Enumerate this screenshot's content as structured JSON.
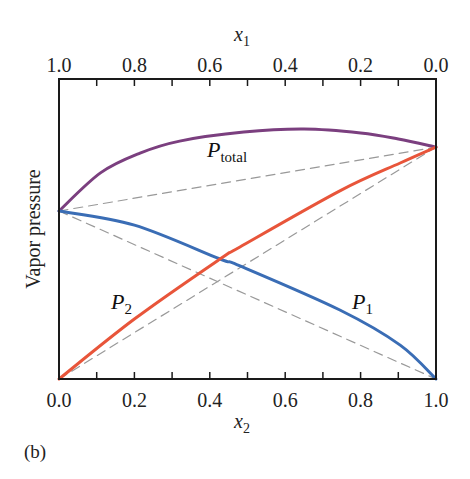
{
  "chart_data": {
    "type": "line",
    "title": "",
    "panel_label": "(b)",
    "xlabel": "x2",
    "xlabel_main": "x",
    "xlabel_sub": "2",
    "x2label": "x1",
    "x2label_main": "x",
    "x2label_sub": "1",
    "ylabel": "Vapor pressure",
    "xlim": [
      0.0,
      1.0
    ],
    "ylim": [
      0,
      1
    ],
    "grid": false,
    "bottom_ticks": [
      "0.0",
      "0.2",
      "0.4",
      "0.6",
      "0.8",
      "1.0"
    ],
    "top_ticks": [
      "1.0",
      "0.8",
      "0.6",
      "0.4",
      "0.2",
      "0.0"
    ],
    "series": [
      {
        "name": "P_total",
        "label_main": "P",
        "label_sub": "total",
        "color": "#7b3f7f",
        "style": "solid",
        "x": [
          0.0,
          0.11,
          0.215,
          0.32,
          0.49,
          0.65,
          0.8,
          0.9,
          1.0
        ],
        "y": [
          0.56,
          0.687,
          0.753,
          0.793,
          0.823,
          0.833,
          0.82,
          0.8,
          0.773
        ]
      },
      {
        "name": "P1",
        "label_main": "P",
        "label_sub": "1",
        "color": "#3a6db5",
        "style": "solid",
        "x": [
          0.0,
          0.2,
          0.427,
          0.48,
          0.745,
          0.905,
          1.0
        ],
        "y": [
          0.56,
          0.513,
          0.4,
          0.377,
          0.23,
          0.113,
          0.0
        ]
      },
      {
        "name": "P2",
        "label_main": "P",
        "label_sub": "2",
        "color": "#e8553a",
        "style": "solid",
        "x": [
          0.0,
          0.2,
          0.427,
          0.48,
          0.745,
          0.905,
          1.0
        ],
        "y": [
          0.0,
          0.2,
          0.4,
          0.44,
          0.627,
          0.72,
          0.773
        ]
      },
      {
        "name": "P_total ideal (Raoult)",
        "color": "#999999",
        "style": "dashed",
        "x": [
          0.0,
          1.0
        ],
        "y": [
          0.56,
          0.773
        ]
      },
      {
        "name": "P1 ideal (Raoult)",
        "color": "#999999",
        "style": "dashed",
        "x": [
          0.0,
          1.0
        ],
        "y": [
          0.56,
          0.0
        ]
      },
      {
        "name": "P2 ideal (Raoult)",
        "color": "#999999",
        "style": "dashed",
        "x": [
          0.0,
          1.0
        ],
        "y": [
          0.0,
          0.773
        ]
      }
    ]
  }
}
